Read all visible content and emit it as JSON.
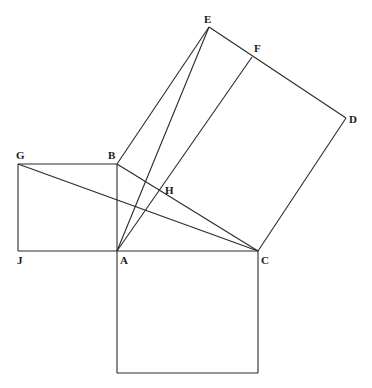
{
  "diagram": {
    "colors": {
      "line": "#2a2a2a",
      "label": "#1a1a1a",
      "background": "#ffffff"
    },
    "points": {
      "A": [
        117,
        251
      ],
      "B": [
        117,
        164
      ],
      "C": [
        258,
        251
      ],
      "D": [
        346,
        118
      ],
      "E": [
        209,
        27
      ],
      "F": [
        252,
        57
      ],
      "G": [
        18,
        164
      ],
      "H": [
        161,
        190
      ],
      "J": [
        18,
        251
      ],
      "K": [
        117,
        373
      ],
      "L": [
        258,
        373
      ]
    },
    "labels": [
      {
        "text": "E",
        "x": 204,
        "y": 23
      },
      {
        "text": "F",
        "x": 254,
        "y": 52
      },
      {
        "text": "D",
        "x": 349,
        "y": 123
      },
      {
        "text": "G",
        "x": 16,
        "y": 159
      },
      {
        "text": "B",
        "x": 108,
        "y": 159
      },
      {
        "text": "H",
        "x": 165,
        "y": 194
      },
      {
        "text": "J",
        "x": 17,
        "y": 264
      },
      {
        "text": "A",
        "x": 120,
        "y": 264
      },
      {
        "text": "C",
        "x": 261,
        "y": 264
      }
    ],
    "segments": [
      [
        "G",
        "B"
      ],
      [
        "G",
        "J"
      ],
      [
        "J",
        "A"
      ],
      [
        "B",
        "A"
      ],
      [
        "B",
        "E"
      ],
      [
        "E",
        "D"
      ],
      [
        "D",
        "C"
      ],
      [
        "A",
        "C"
      ],
      [
        "B",
        "C"
      ],
      [
        "A",
        "K"
      ],
      [
        "K",
        "L"
      ],
      [
        "L",
        "C"
      ],
      [
        "G",
        "C"
      ],
      [
        "A",
        "E"
      ],
      [
        "A",
        "F"
      ]
    ]
  }
}
